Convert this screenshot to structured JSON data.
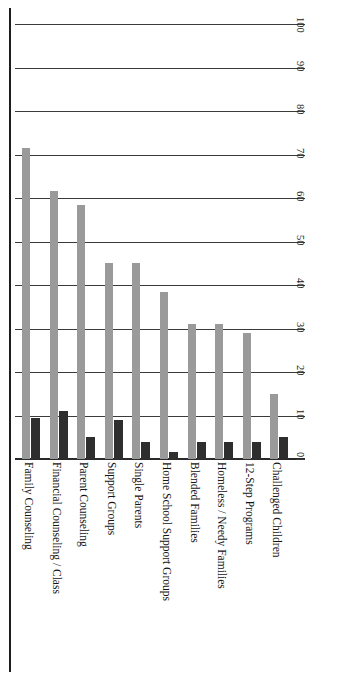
{
  "chart_data": {
    "type": "bar",
    "title": "",
    "xlabel": "",
    "ylabel": "",
    "ylim": [
      0,
      100
    ],
    "grid": true,
    "legend": "none",
    "orientation": "vertical-bars-rotated-labels",
    "categories": [
      "Family Counseling",
      "Financial Counseling / Class",
      "Parent Counseling",
      "Support Groups",
      "Single Parents",
      "Home School Support Groups",
      "Blended Families",
      "Homeless / Needy Families",
      "12-Step Programs",
      "Challenged Children"
    ],
    "series": [
      {
        "name": "Primary",
        "color": "#9a9a9a",
        "values": [
          71.5,
          61.5,
          58.5,
          45,
          45,
          38.5,
          31,
          31,
          29,
          15
        ]
      },
      {
        "name": "Secondary",
        "color": "#2e2e2e",
        "values": [
          9.5,
          11,
          5,
          9,
          4,
          1.5,
          4,
          4,
          4,
          5
        ]
      }
    ],
    "ticks": [
      0,
      10,
      20,
      30,
      40,
      50,
      60,
      70,
      80,
      90,
      100
    ],
    "tick_labels": [
      "0",
      "10",
      "20",
      "30",
      "40",
      "50",
      "60",
      "70",
      "80",
      "90",
      "100"
    ]
  }
}
